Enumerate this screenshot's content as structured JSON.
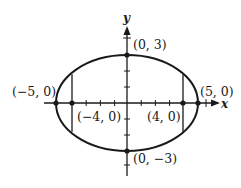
{
  "diagram": {
    "type": "ellipse-plot",
    "equation_params": {
      "a": 5,
      "b": 3,
      "c": 4
    },
    "axes": {
      "x_label": "x",
      "y_label": "y"
    },
    "points": {
      "top_vertex": "(0, 3)",
      "bottom_vertex": "(0, −3)",
      "left_vertex": "(−5, 0)",
      "right_vertex": "(5, 0)",
      "left_focus": "(−4, 0)",
      "right_focus": "(4, 0)"
    },
    "colors": {
      "stroke": "#1a1a1a",
      "background": "#ffffff"
    }
  }
}
